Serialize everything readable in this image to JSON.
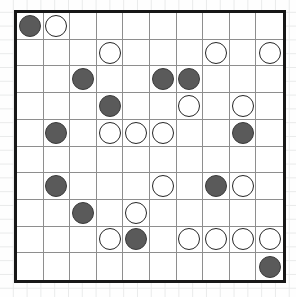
{
  "board": {
    "title": "reversi-board",
    "rows": 10,
    "cols": 10,
    "colors": {
      "dark_stone": "#5a5a5a",
      "dark_stone_outline": "#3a3a3a",
      "light_stone": "#ffffff",
      "light_stone_outline": "#262626",
      "gridline": "#8e8e8e",
      "border": "#171717",
      "board_background": "#ffffff",
      "page_background": "#fefefe",
      "page_grid": "#e9eaea"
    },
    "legend": {
      "empty": "",
      "dark": "dark-stone",
      "light": "light-stone"
    },
    "cells": [
      [
        "dark",
        "light",
        "",
        "",
        "",
        "",
        "",
        "",
        "",
        ""
      ],
      [
        "",
        "",
        "",
        "light",
        "",
        "",
        "",
        "light",
        "",
        "light"
      ],
      [
        "",
        "",
        "dark",
        "",
        "",
        "dark",
        "dark",
        "",
        "",
        ""
      ],
      [
        "",
        "",
        "",
        "dark",
        "",
        "",
        "light",
        "",
        "light",
        ""
      ],
      [
        "",
        "dark",
        "",
        "light",
        "light",
        "light",
        "",
        "",
        "dark",
        ""
      ],
      [
        "",
        "",
        "",
        "",
        "",
        "",
        "",
        "",
        "",
        ""
      ],
      [
        "",
        "dark",
        "",
        "",
        "",
        "light",
        "",
        "dark",
        "light",
        ""
      ],
      [
        "",
        "",
        "dark",
        "",
        "light",
        "",
        "",
        "",
        "",
        ""
      ],
      [
        "",
        "",
        "",
        "light",
        "dark",
        "",
        "light",
        "light",
        "light",
        "light"
      ],
      [
        "",
        "",
        "",
        "",
        "",
        "",
        "",
        "",
        "",
        "dark"
      ]
    ],
    "counts": {
      "dark": 13,
      "light": 19,
      "empty": 68
    }
  }
}
